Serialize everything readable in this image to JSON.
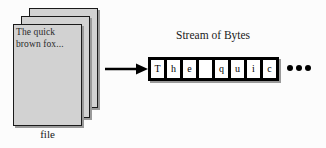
{
  "diagram": {
    "colors": {
      "background": "#fcfcfc",
      "page_fill": "#d2d2d2",
      "outline": "#000000",
      "shadow": "#9a9a9a",
      "cell_fill": "#ffffff"
    },
    "file": {
      "page_count": 3,
      "document_text_line1": "The quick",
      "document_text_line2": "brown fox...",
      "caption": "file"
    },
    "arrow": {
      "icon": "right-arrow-icon",
      "direction": "right"
    },
    "stream": {
      "title": "Stream of Bytes",
      "bytes": [
        {
          "char": "T"
        },
        {
          "char": "h"
        },
        {
          "char": "e"
        },
        {
          "char": ""
        },
        {
          "char": "q"
        },
        {
          "char": "u"
        },
        {
          "char": "i"
        },
        {
          "char": "c"
        }
      ],
      "continuation": {
        "icon": "ellipsis-icon",
        "dot_count": 3
      }
    }
  }
}
